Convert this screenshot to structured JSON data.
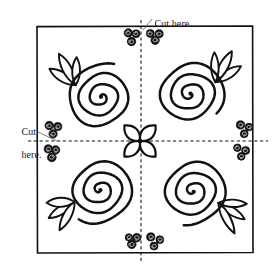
{
  "document": {
    "title": "Cut-here rose quilt block diagram",
    "background_color": "#ffffff",
    "ink_color": "#111111",
    "width": 273,
    "height": 269
  },
  "annotations": {
    "top_label": "Cut here.",
    "left_label_line1": "Cut",
    "left_label_line2": "here."
  },
  "border": {
    "name": "outer-border-rectangle",
    "x": 37,
    "y": 26,
    "width": 216,
    "height": 227,
    "stroke_color": "#111111",
    "stroke_width": 1.6
  },
  "cut_lines": [
    {
      "name": "vertical-cut-line",
      "orientation": "vertical",
      "x": 141,
      "y1": 20,
      "y2": 262,
      "style": "dashed"
    },
    {
      "name": "horizontal-cut-line",
      "orientation": "horizontal",
      "y": 141,
      "x1": 28,
      "x2": 268,
      "style": "dashed"
    }
  ],
  "leader_lines": [
    {
      "name": "top-leader-line",
      "x1": 152,
      "y1": 19,
      "x2": 143,
      "y2": 30
    },
    {
      "name": "left-leader-line",
      "x1": 38,
      "y1": 132,
      "x2": 57,
      "y2": 141
    }
  ],
  "roses": [
    {
      "name": "rose-top-left",
      "cx": 101,
      "cy": 97,
      "radius": 35,
      "turns": 3.1,
      "leaf_direction": "up-left",
      "leaf_angles": [
        -148,
        -118,
        -88
      ],
      "quadrant": "top-left"
    },
    {
      "name": "rose-top-right",
      "cx": 190,
      "cy": 94,
      "radius": 35,
      "turns": 3.1,
      "leaf_direction": "up-right",
      "leaf_angles": [
        -32,
        -62,
        -92
      ],
      "quadrant": "top-right"
    },
    {
      "name": "rose-bottom-left",
      "cx": 100,
      "cy": 190,
      "radius": 35,
      "turns": 3.1,
      "leaf_direction": "down-left",
      "leaf_angles": [
        148,
        118,
        178
      ],
      "quadrant": "bottom-left"
    },
    {
      "name": "rose-bottom-right",
      "cx": 193,
      "cy": 191,
      "radius": 35,
      "turns": 3.1,
      "leaf_direction": "down-right",
      "leaf_angles": [
        32,
        62,
        2
      ],
      "quadrant": "bottom-right"
    }
  ],
  "center_flower": {
    "name": "center-four-petal-flower",
    "cx": 140,
    "cy": 141,
    "petal_count": 4,
    "petal_angles": [
      45,
      135,
      225,
      315
    ],
    "petal_length": 22,
    "petal_width": 9
  },
  "berry_clusters": [
    {
      "name": "berry-cluster-top-left-of-vline",
      "anchor_x": 132,
      "anchor_y": 36,
      "count": 3,
      "position": "top-center-left"
    },
    {
      "name": "berry-cluster-top-right-of-vline",
      "anchor_x": 155,
      "anchor_y": 36,
      "count": 3,
      "position": "top-center-right"
    },
    {
      "name": "berry-cluster-bottom-left-of-vline",
      "anchor_x": 133,
      "anchor_y": 240,
      "count": 3,
      "position": "bottom-center-left"
    },
    {
      "name": "berry-cluster-bottom-right-of-vline",
      "anchor_x": 155,
      "anchor_y": 241,
      "count": 3,
      "position": "bottom-center-right"
    },
    {
      "name": "berry-cluster-left-above-hline",
      "anchor_x": 54,
      "anchor_y": 129,
      "count": 3,
      "position": "left-upper"
    },
    {
      "name": "berry-cluster-left-below-hline",
      "anchor_x": 52,
      "anchor_y": 152,
      "count": 3,
      "position": "left-lower"
    },
    {
      "name": "berry-cluster-right-above-hline",
      "anchor_x": 244,
      "anchor_y": 129,
      "count": 3,
      "position": "right-upper"
    },
    {
      "name": "berry-cluster-right-below-hline",
      "anchor_x": 242,
      "anchor_y": 152,
      "count": 3,
      "position": "right-lower"
    }
  ]
}
